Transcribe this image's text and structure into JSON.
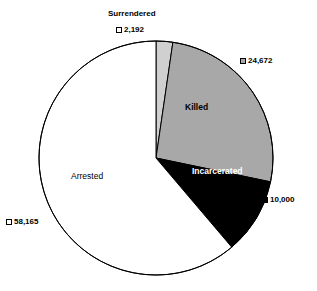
{
  "chart_data": {
    "type": "pie",
    "title": "",
    "subtitle": "",
    "xlabel": "",
    "ylabel": "",
    "legend_position": "none",
    "grid": false,
    "total": 95029,
    "start_angle_deg": 0,
    "direction": "clockwise",
    "categories": [
      "Surrendered",
      "Killed",
      "Incarcerated",
      "Arrested"
    ],
    "values": [
      2192,
      24672,
      10000,
      58165
    ],
    "value_labels": [
      "2,192",
      "24,672",
      "10,000",
      "58,165"
    ],
    "colors": [
      "#d0d0d0",
      "#a8a8a8",
      "#000000",
      "#ffffff"
    ],
    "slices": [
      {
        "name": "Surrendered",
        "value": 2192,
        "value_label": "2,192",
        "percent": 2.3,
        "angle_deg": 8.3,
        "fill": "#d0d0d0",
        "marker": "white-square",
        "external_title": "Surrendered",
        "inside_label": ""
      },
      {
        "name": "Killed",
        "value": 24672,
        "value_label": "24,672",
        "percent": 26.0,
        "angle_deg": 93.4,
        "fill": "#a8a8a8",
        "marker": "gray-square",
        "external_title": "",
        "inside_label": "Killed"
      },
      {
        "name": "Incarcerated",
        "value": 10000,
        "value_label": "10,000",
        "percent": 10.5,
        "angle_deg": 37.9,
        "fill": "#000000",
        "marker": "black-square",
        "external_title": "",
        "inside_label": "Incarcerated"
      },
      {
        "name": "Arrested",
        "value": 58165,
        "value_label": "58,165",
        "percent": 61.2,
        "angle_deg": 220.3,
        "fill": "#ffffff",
        "marker": "white-square",
        "external_title": "",
        "inside_label": "Arrested"
      }
    ]
  },
  "figure": {
    "background": "#ffffff",
    "outline_color": "#000000",
    "center_x": 156,
    "center_y": 158,
    "radius": 117
  }
}
